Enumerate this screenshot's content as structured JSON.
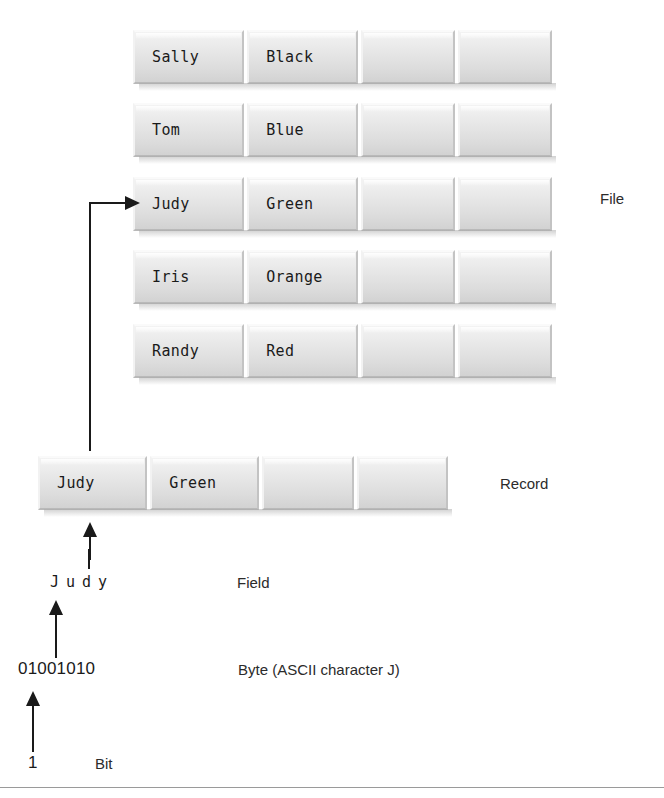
{
  "diagram": {
    "file": {
      "label": "File",
      "rows": [
        {
          "name": "Sally",
          "color": "Black",
          "empty1": "",
          "empty2": ""
        },
        {
          "name": "Tom",
          "color": "Blue",
          "empty1": "",
          "empty2": ""
        },
        {
          "name": "Judy",
          "color": "Green",
          "empty1": "",
          "empty2": ""
        },
        {
          "name": "Iris",
          "color": "Orange",
          "empty1": "",
          "empty2": ""
        },
        {
          "name": "Randy",
          "color": "Red",
          "empty1": "",
          "empty2": ""
        }
      ]
    },
    "record": {
      "label": "Record",
      "row": {
        "name": "Judy",
        "color": "Green",
        "empty1": "",
        "empty2": ""
      }
    },
    "field": {
      "label": "Field",
      "value": "Judy"
    },
    "byte": {
      "label": "Byte (ASCII character J)",
      "value": "01001010"
    },
    "bit": {
      "label": "Bit",
      "value": "1"
    },
    "colors": {
      "ink": "#1a1a1a",
      "bar_face": "#e6e6e6",
      "bar_highlight": "#fafafa",
      "bar_shadow": "#b9b9b9",
      "rule": "#9a9a9a"
    }
  }
}
